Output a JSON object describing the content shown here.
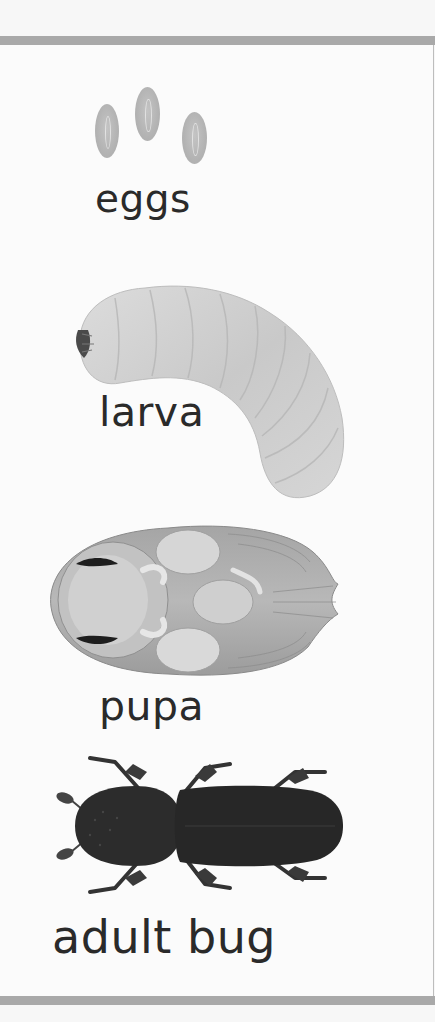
{
  "stages": [
    {
      "id": "eggs",
      "label": "eggs",
      "icon": "eggs-icon"
    },
    {
      "id": "larva",
      "label": "larva",
      "icon": "larva-icon"
    },
    {
      "id": "pupa",
      "label": "pupa",
      "icon": "pupa-icon"
    },
    {
      "id": "adult",
      "label": "adult bug",
      "icon": "beetle-icon"
    }
  ],
  "colors": {
    "band": "#a9a9a9",
    "background": "#fbfbfb",
    "text": "#2a2a2a",
    "larva": "#cfcfcf",
    "pupa": "#9a9a9a",
    "adult": "#2b2b2b"
  }
}
